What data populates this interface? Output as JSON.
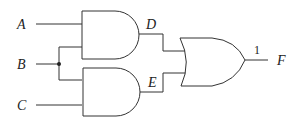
{
  "diagram": {
    "type": "logic-circuit",
    "inputs": [
      {
        "id": "A",
        "label": "A"
      },
      {
        "id": "B",
        "label": "B"
      },
      {
        "id": "C",
        "label": "C"
      }
    ],
    "gates": [
      {
        "id": "and1",
        "type": "AND",
        "inputs": [
          "A",
          "B"
        ],
        "output": "D"
      },
      {
        "id": "and2",
        "type": "AND",
        "inputs": [
          "B",
          "C"
        ],
        "output": "E"
      },
      {
        "id": "or1",
        "type": "OR",
        "inputs": [
          "D",
          "E"
        ],
        "output": "F"
      }
    ],
    "intermediate_labels": {
      "D": "D",
      "E": "E"
    },
    "output": {
      "label": "F",
      "value": "1"
    }
  }
}
